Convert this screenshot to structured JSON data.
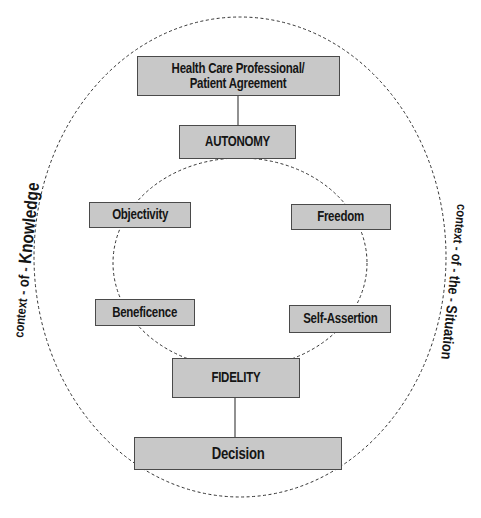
{
  "diagram": {
    "boxes": {
      "agreement": {
        "line1": "Health Care Professional/",
        "line2": "Patient Agreement"
      },
      "autonomy": "AUTONOMY",
      "objectivity": "Objectivity",
      "freedom": "Freedom",
      "beneficence": "Beneficence",
      "self_assertion": "Self-Assertion",
      "fidelity": "FIDELITY",
      "decision": "Decision"
    },
    "side_labels": {
      "left": {
        "w1": "context",
        "w2": "of",
        "w3": "Knowledge"
      },
      "right": {
        "w1": "context",
        "w2": "of",
        "w3": "the",
        "w4": "Situation"
      }
    },
    "colors": {
      "box_fill": "#c8c8c8",
      "box_border": "#4a4a4a",
      "dashed_line": "#333333",
      "text": "#151515"
    }
  }
}
